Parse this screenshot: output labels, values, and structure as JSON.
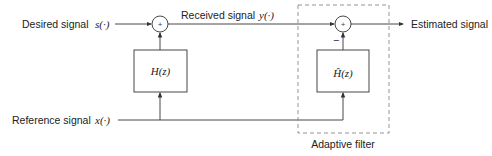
{
  "inputs": {
    "desired_label": "Desired signal",
    "desired_symbol": "s(·)",
    "reference_label": "Reference signal",
    "reference_symbol": "x(·)"
  },
  "signals": {
    "received_label": "Received signal",
    "received_symbol": "y(·)",
    "output_label": "Estimated signal"
  },
  "blocks": {
    "plant": "H(z)",
    "estimate": "Ĥ(z)",
    "adaptive_label": "Adaptive filter"
  },
  "summers": {
    "sum1_sign": "+",
    "sum2_sign": "+",
    "sum2_minus": "−"
  },
  "colors": {
    "line": "#333333",
    "dashed": "#888888"
  }
}
